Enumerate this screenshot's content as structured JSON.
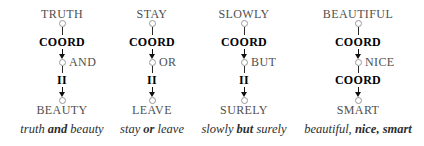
{
  "figure": {
    "description_colors": {
      "background": "#ffffff",
      "word_text": "#4f4f4f",
      "edge_label_text": "#000000",
      "edge_line": "#111111",
      "node_outline": "#999999"
    },
    "diagrams": [
      {
        "top_word": "TRUTH",
        "edge1_label": "COORD",
        "conjunction": "AND",
        "edge2_label": "II",
        "bottom_word": "BEAUTY",
        "caption": {
          "pre": "truth ",
          "bold": "and",
          "post": " beauty"
        }
      },
      {
        "top_word": "STAY",
        "edge1_label": "COORD",
        "conjunction": "OR",
        "edge2_label": "II",
        "bottom_word": "LEAVE",
        "caption": {
          "pre": "stay ",
          "bold": "or",
          "post": " leave"
        }
      },
      {
        "top_word": "SLOWLY",
        "edge1_label": "COORD",
        "conjunction": "BUT",
        "edge2_label": "II",
        "bottom_word": "SURELY",
        "caption": {
          "pre": "slowly ",
          "bold": "but",
          "post": " surely"
        }
      },
      {
        "top_word": "BEAUTIFUL",
        "edge1_label": "COORD",
        "conjunction": "NICE",
        "edge2_label": "COORD",
        "bottom_word": "SMART",
        "caption": {
          "pre": "beautiful, ",
          "bold": "nice, smart",
          "post": ""
        }
      }
    ]
  }
}
